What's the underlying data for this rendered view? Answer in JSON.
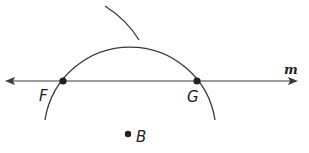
{
  "diagram": {
    "line": {
      "name": "m",
      "from": [
        6,
        81
      ],
      "to": [
        297,
        81
      ]
    },
    "points": [
      {
        "label": "F",
        "x": 63,
        "y": 81,
        "label_x": 40,
        "label_y": 100
      },
      {
        "label": "G",
        "x": 197,
        "y": 81,
        "label_x": 187,
        "label_y": 101
      },
      {
        "label": "B",
        "x": 128,
        "y": 134,
        "label_x": 136,
        "label_y": 141
      }
    ],
    "arcs": [
      {
        "type": "large-arc",
        "center": [
          130,
          135
        ],
        "radius": 86,
        "start": [
          45,
          120
        ],
        "end": [
          215,
          120
        ]
      },
      {
        "type": "small-arc",
        "start": [
          105,
          6
        ],
        "end": [
          139,
          40
        ]
      }
    ],
    "colors": {
      "stroke": "#3a3a3a",
      "point": "#231f20"
    }
  }
}
